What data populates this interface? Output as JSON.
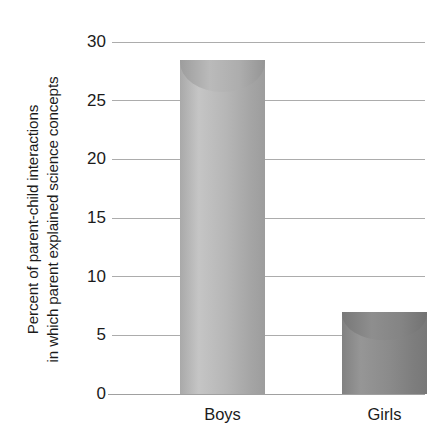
{
  "chart_data": {
    "type": "bar",
    "title": "",
    "xlabel": "",
    "ylabel_line1": "Percent of parent-child interactions",
    "ylabel_line2": "in which parent explained science concepts",
    "categories": [
      "Boys",
      "Girls"
    ],
    "values": [
      28.5,
      7.0
    ],
    "series": [
      {
        "name": "Percent of parent-child interactions in which parent explained science concepts",
        "values": [
          28.5,
          7.0
        ]
      }
    ],
    "ylim": [
      0,
      30
    ],
    "yticks": [
      0,
      5,
      10,
      15,
      20,
      25,
      30
    ],
    "ytick_labels": [
      "0",
      "5",
      "10",
      "15",
      "20",
      "25",
      "30"
    ],
    "grid": true,
    "legend": false,
    "legend_position": "none",
    "bar_style": "cylinder",
    "bar_colors": [
      "#b6b6b6",
      "#8b8b8b"
    ],
    "gridline_color": "#9d9d9d",
    "axis_color": "#8f8f8f",
    "text_color": "#1b1b1b",
    "background": "#ffffff"
  }
}
